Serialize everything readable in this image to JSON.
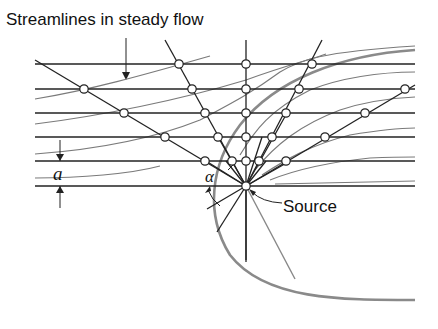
{
  "title": "Streamlines in steady flow",
  "labels": {
    "source": "Source",
    "spacing": "a",
    "angle": "α"
  },
  "colors": {
    "line": "#222222",
    "streamline": "#777777",
    "envelope": "#888888",
    "node_fill": "#ffffff"
  },
  "geometry": {
    "source": [
      246,
      186
    ],
    "horizontal_lines_y": [
      64,
      89,
      113,
      137,
      161,
      186
    ],
    "line_x_range": [
      35,
      415
    ]
  }
}
